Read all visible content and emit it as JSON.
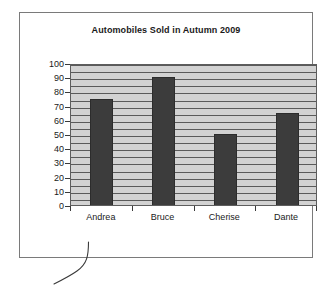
{
  "chart_data": {
    "type": "bar",
    "title": "Automobiles Sold in Autumn 2009",
    "categories": [
      "Andrea",
      "Bruce",
      "Cherise",
      "Dante"
    ],
    "values": [
      75,
      90,
      50,
      65
    ],
    "xlabel": "",
    "ylabel": "",
    "ylim": [
      0,
      100
    ],
    "y_ticks": [
      0,
      10,
      20,
      30,
      40,
      50,
      60,
      70,
      80,
      90,
      100
    ],
    "y_tick_labels": [
      "0",
      "10",
      "20",
      "30",
      "40",
      "50",
      "60",
      "70",
      "80",
      "90",
      "100"
    ],
    "minor_gridline_step": 5,
    "grid": true,
    "legend": false,
    "legend_position": "none",
    "colors": {
      "bar": "#3c3c3c",
      "plot_background": "#d2d2d2",
      "gridline": "#5a5a5a",
      "axis": "#3a3a3a",
      "panel_border": "#7a7a7a",
      "text": "#1a1a1a",
      "page_background": "#ffffff"
    }
  },
  "annotations": {
    "hook_curve_name": "pointer-curve-stroke"
  }
}
